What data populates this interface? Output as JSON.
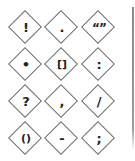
{
  "palette": {
    "title": "Punctuation symbols",
    "tiles": [
      {
        "symbol": "!",
        "name": "exclamation-mark"
      },
      {
        "symbol": ".",
        "name": "period"
      },
      {
        "symbol": "“”",
        "name": "quotation-marks"
      },
      {
        "symbol": "•",
        "name": "bullet"
      },
      {
        "symbol": "[]",
        "name": "brackets"
      },
      {
        "symbol": ":",
        "name": "colon"
      },
      {
        "symbol": "?",
        "name": "question-mark"
      },
      {
        "symbol": ",",
        "name": "comma"
      },
      {
        "symbol": "/",
        "name": "slash"
      },
      {
        "symbol": "()",
        "name": "parentheses"
      },
      {
        "symbol": "-",
        "name": "hyphen"
      },
      {
        "symbol": ";",
        "name": "semicolon"
      }
    ]
  },
  "colors": {
    "diamond_border": "#6e6e6e",
    "glyph": "#222222",
    "divider": "#8a8a8a",
    "background": "#ffffff"
  }
}
